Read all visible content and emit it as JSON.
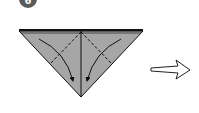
{
  "step": {
    "number": "6",
    "color": "#5a5a5a"
  },
  "diagram": {
    "paper_color": "#a6a6a6",
    "line_color": "#111111",
    "next_arrow": "hollow-right-arrow"
  }
}
